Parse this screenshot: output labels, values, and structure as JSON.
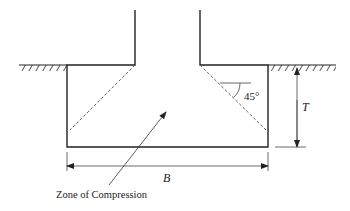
{
  "diagram": {
    "labels": {
      "angle": "45°",
      "depth": "T",
      "width": "B",
      "zone": "Zone of Compression"
    },
    "colors": {
      "line": "#222222",
      "dashed": "#555555",
      "hatch": "#333333",
      "background": "#ffffff"
    }
  }
}
